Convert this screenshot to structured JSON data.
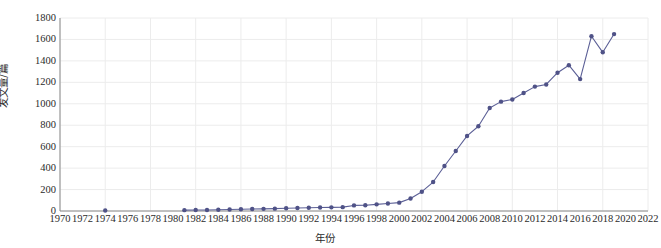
{
  "chart_data": {
    "type": "line",
    "title": "",
    "subtitle": "",
    "xlabel": "年份",
    "ylabel": "发文量/篇",
    "xlim": [
      1970,
      2022
    ],
    "ylim": [
      0,
      1800
    ],
    "grid": true,
    "legend": false,
    "legend_position": "none",
    "line_color": "#5b5f96",
    "marker_color": "#4f5287",
    "marker_shape": "circle",
    "x_tick_labels": [
      "1970",
      "1972",
      "1974",
      "1976",
      "1978",
      "1980",
      "1982",
      "1984",
      "1986",
      "1988",
      "1990",
      "1992",
      "1994",
      "1996",
      "1998",
      "2000",
      "2002",
      "2004",
      "2006",
      "2008",
      "2010",
      "2012",
      "2014",
      "2016",
      "2018",
      "2020",
      "2022"
    ],
    "x_tick_values": [
      1970,
      1972,
      1974,
      1976,
      1978,
      1980,
      1982,
      1984,
      1986,
      1988,
      1990,
      1992,
      1994,
      1996,
      1998,
      2000,
      2002,
      2004,
      2006,
      2008,
      2010,
      2012,
      2014,
      2016,
      2018,
      2020,
      2022
    ],
    "y_tick_labels": [
      "0",
      "200",
      "400",
      "600",
      "800",
      "1000",
      "1200",
      "1400",
      "1600",
      "1800"
    ],
    "y_tick_values": [
      0,
      200,
      400,
      600,
      800,
      1000,
      1200,
      1400,
      1600,
      1800
    ],
    "series": [
      {
        "name": "发文量",
        "connected": false,
        "points": [
          {
            "x": 1974,
            "y": 4
          }
        ]
      },
      {
        "name": "发文量",
        "connected": true,
        "x": [
          1981,
          1982,
          1983,
          1984,
          1985,
          1986,
          1987,
          1988,
          1989,
          1990,
          1991,
          1992,
          1993,
          1994,
          1995,
          1996,
          1997,
          1998,
          1999,
          2000,
          2001,
          2002,
          2003,
          2004,
          2005,
          2006,
          2007,
          2008,
          2009,
          2010,
          2011,
          2012,
          2013,
          2014,
          2015,
          2016,
          2017,
          2018,
          2019
        ],
        "values": [
          8,
          10,
          10,
          12,
          14,
          16,
          18,
          20,
          22,
          26,
          28,
          30,
          32,
          34,
          36,
          52,
          54,
          62,
          70,
          78,
          116,
          180,
          270,
          420,
          560,
          700,
          790,
          960,
          1020,
          1040,
          1100,
          1160,
          1180,
          1290,
          1360,
          1230,
          1630,
          1480,
          1650
        ]
      }
    ]
  }
}
